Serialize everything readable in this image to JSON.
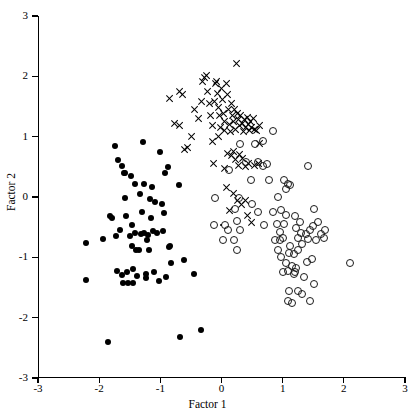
{
  "chart_data": {
    "type": "scatter",
    "title": "",
    "xlabel": "Factor 1",
    "ylabel": "Factor 2",
    "xlim": [
      -3,
      3
    ],
    "ylim": [
      -3,
      3
    ],
    "xticks": [
      -3,
      -2,
      -1,
      0,
      1,
      2,
      3
    ],
    "yticks": [
      -3,
      -2,
      -1,
      0,
      1,
      2,
      3
    ],
    "xticklabels": [
      "-3",
      "-2",
      "-1",
      "0",
      "1",
      "2",
      "3"
    ],
    "yticklabels": [
      "-3",
      "-2",
      "-1",
      "0",
      "1",
      "2",
      "3"
    ],
    "grid": false,
    "legend": "none",
    "series": [
      {
        "name": "Group 1",
        "marker": "filled-circle",
        "color": "#000000",
        "points": [
          [
            -2.22,
            -0.76
          ],
          [
            -2.22,
            -1.38
          ],
          [
            -1.93,
            -0.7
          ],
          [
            -1.86,
            -2.41
          ],
          [
            -1.82,
            -0.32
          ],
          [
            -1.79,
            -0.34
          ],
          [
            -1.74,
            0.84
          ],
          [
            -1.72,
            -0.64
          ],
          [
            -1.71,
            -1.22
          ],
          [
            -1.69,
            0.62
          ],
          [
            -1.66,
            -0.55
          ],
          [
            -1.63,
            0.52
          ],
          [
            -1.62,
            -1.3
          ],
          [
            -1.61,
            -1.42
          ],
          [
            -1.6,
            0.39
          ],
          [
            -1.58,
            -0.01
          ],
          [
            -1.56,
            -0.31
          ],
          [
            -1.55,
            -1.25
          ],
          [
            -1.53,
            -1.43
          ],
          [
            -1.5,
            -0.65
          ],
          [
            -1.48,
            0.35
          ],
          [
            -1.47,
            -0.46
          ],
          [
            -1.46,
            -0.81
          ],
          [
            -1.45,
            -1.2
          ],
          [
            -1.44,
            -1.42
          ],
          [
            -1.42,
            0.22
          ],
          [
            -1.41,
            -0.59
          ],
          [
            -1.4,
            -0.88
          ],
          [
            -1.38,
            -1.31
          ],
          [
            -1.35,
            -0.88
          ],
          [
            -1.33,
            0.05
          ],
          [
            -1.32,
            -0.62
          ],
          [
            -1.3,
            -0.25
          ],
          [
            -1.28,
            0.91
          ],
          [
            -1.27,
            0.21
          ],
          [
            -1.26,
            -0.6
          ],
          [
            -1.24,
            -1.28
          ],
          [
            -1.22,
            -0.72
          ],
          [
            -1.2,
            -0.63
          ],
          [
            -1.18,
            -0.88
          ],
          [
            -1.17,
            -0.04
          ],
          [
            -1.15,
            -0.35
          ],
          [
            -1.13,
            0.16
          ],
          [
            -1.12,
            -0.57
          ],
          [
            -1.1,
            -1.24
          ],
          [
            -1.08,
            -0.08
          ],
          [
            -1.05,
            -0.6
          ],
          [
            -1.02,
            -1.4
          ],
          [
            -1.0,
            0.75
          ],
          [
            -0.98,
            -0.12
          ],
          [
            -0.96,
            -0.56
          ],
          [
            -0.94,
            -0.26
          ],
          [
            -0.92,
            0.4
          ],
          [
            -0.9,
            -1.33
          ],
          [
            -0.88,
            0.5
          ],
          [
            -0.86,
            -0.83
          ],
          [
            -0.84,
            -0.82
          ],
          [
            -0.82,
            -1.1
          ],
          [
            -0.7,
            0.2
          ],
          [
            -0.68,
            -2.32
          ],
          [
            -0.62,
            -1.05
          ],
          [
            -0.45,
            -1.27
          ],
          [
            -0.33,
            -2.21
          ],
          [
            -1.58,
            0.4
          ],
          [
            -1.23,
            -1.35
          ]
        ]
      },
      {
        "name": "Group 2",
        "marker": "x",
        "color": "#000000",
        "points": [
          [
            -0.85,
            1.64
          ],
          [
            -0.68,
            1.75
          ],
          [
            -0.63,
            1.7
          ],
          [
            -0.76,
            1.22
          ],
          [
            -0.68,
            1.18
          ],
          [
            -0.6,
            0.78
          ],
          [
            -0.55,
            0.82
          ],
          [
            -0.48,
            1.0
          ],
          [
            -0.44,
            1.45
          ],
          [
            -0.38,
            1.3
          ],
          [
            -0.33,
            1.58
          ],
          [
            -0.3,
            1.92
          ],
          [
            -0.28,
            1.98
          ],
          [
            -0.25,
            2.02
          ],
          [
            -0.22,
            1.75
          ],
          [
            -0.2,
            1.55
          ],
          [
            -0.18,
            1.35
          ],
          [
            -0.15,
            1.18
          ],
          [
            -0.14,
            0.92
          ],
          [
            -0.11,
            1.58
          ],
          [
            -0.1,
            1.88
          ],
          [
            -0.08,
            1.92
          ],
          [
            -0.06,
            1.72
          ],
          [
            -0.05,
            1.48
          ],
          [
            -0.03,
            1.35
          ],
          [
            -0.02,
            1.15
          ],
          [
            0.0,
            1.8
          ],
          [
            0.02,
            1.62
          ],
          [
            0.03,
            1.38
          ],
          [
            0.05,
            1.25
          ],
          [
            0.06,
            1.1
          ],
          [
            0.08,
            1.88
          ],
          [
            0.1,
            1.7
          ],
          [
            0.11,
            1.45
          ],
          [
            0.13,
            1.2
          ],
          [
            0.15,
            1.08
          ],
          [
            0.16,
            1.55
          ],
          [
            0.18,
            1.35
          ],
          [
            0.2,
            1.25
          ],
          [
            0.22,
            1.45
          ],
          [
            0.24,
            1.12
          ],
          [
            0.25,
            2.22
          ],
          [
            0.26,
            1.38
          ],
          [
            0.28,
            1.28
          ],
          [
            0.3,
            1.18
          ],
          [
            0.32,
            1.35
          ],
          [
            0.34,
            1.22
          ],
          [
            0.36,
            1.08
          ],
          [
            0.38,
            1.28
          ],
          [
            0.4,
            1.15
          ],
          [
            0.42,
            1.32
          ],
          [
            0.44,
            1.2
          ],
          [
            0.46,
            1.1
          ],
          [
            0.48,
            1.25
          ],
          [
            0.5,
            1.15
          ],
          [
            0.52,
            1.3
          ],
          [
            0.55,
            1.12
          ],
          [
            0.58,
            1.1
          ],
          [
            0.62,
            1.18
          ],
          [
            -0.13,
            0.56
          ],
          [
            0.05,
            0.48
          ],
          [
            0.1,
            0.72
          ],
          [
            0.16,
            0.68
          ],
          [
            0.2,
            0.75
          ],
          [
            0.23,
            0.62
          ],
          [
            0.28,
            0.52
          ],
          [
            0.3,
            0.7
          ],
          [
            0.34,
            0.64
          ],
          [
            0.4,
            0.5
          ],
          [
            0.44,
            0.55
          ],
          [
            0.55,
            0.52
          ],
          [
            0.6,
            0.55
          ],
          [
            0.08,
            0.15
          ],
          [
            0.2,
            0.05
          ],
          [
            0.26,
            -0.06
          ],
          [
            0.33,
            -0.12
          ],
          [
            0.4,
            -0.05
          ],
          [
            0.42,
            -0.3
          ],
          [
            0.5,
            -0.42
          ],
          [
            0.62,
            0.88
          ],
          [
            0.14,
            -0.22
          ],
          [
            -0.05,
            1.0
          ]
        ]
      },
      {
        "name": "Group 3",
        "marker": "open-circle",
        "color": "#1a1a1a",
        "points": [
          [
            0.3,
            0.88
          ],
          [
            0.55,
            0.88
          ],
          [
            0.68,
            0.92
          ],
          [
            0.85,
            1.1
          ],
          [
            0.12,
            0.45
          ],
          [
            0.4,
            0.58
          ],
          [
            0.48,
            0.28
          ],
          [
            0.5,
            -0.12
          ],
          [
            0.6,
            -0.25
          ],
          [
            0.7,
            -0.47
          ],
          [
            0.28,
            -0.02
          ],
          [
            0.22,
            -0.2
          ],
          [
            0.25,
            -0.4
          ],
          [
            0.3,
            -0.55
          ],
          [
            0.2,
            -0.72
          ],
          [
            0.25,
            -0.88
          ],
          [
            0.05,
            -0.47
          ],
          [
            -0.1,
            -0.02
          ],
          [
            -0.12,
            -0.47
          ],
          [
            0.9,
            -0.45
          ],
          [
            0.95,
            -0.72
          ],
          [
            0.98,
            -1.0
          ],
          [
            1.0,
            -0.68
          ],
          [
            1.05,
            -1.1
          ],
          [
            1.08,
            -1.22
          ],
          [
            1.1,
            -0.92
          ],
          [
            1.12,
            -0.82
          ],
          [
            1.15,
            -1.15
          ],
          [
            1.18,
            -0.95
          ],
          [
            1.2,
            -1.24
          ],
          [
            1.22,
            -0.52
          ],
          [
            1.25,
            -0.68
          ],
          [
            1.28,
            -0.42
          ],
          [
            1.3,
            -0.6
          ],
          [
            1.05,
            -0.3
          ],
          [
            1.02,
            -0.45
          ],
          [
            0.98,
            -0.22
          ],
          [
            1.08,
            0.22
          ],
          [
            1.02,
            0.28
          ],
          [
            1.05,
            0.14
          ],
          [
            1.12,
            0.2
          ],
          [
            0.92,
            0.0
          ],
          [
            1.2,
            -0.32
          ],
          [
            1.25,
            -0.88
          ],
          [
            1.32,
            -0.78
          ],
          [
            1.38,
            -0.62
          ],
          [
            1.42,
            -0.7
          ],
          [
            1.45,
            -0.55
          ],
          [
            1.5,
            -0.48
          ],
          [
            1.52,
            -0.2
          ],
          [
            1.55,
            -0.72
          ],
          [
            1.48,
            -1.02
          ],
          [
            1.4,
            -1.08
          ],
          [
            1.42,
            0.52
          ],
          [
            1.52,
            -1.45
          ],
          [
            1.1,
            -1.55
          ],
          [
            1.08,
            -1.72
          ],
          [
            1.15,
            -1.75
          ],
          [
            1.25,
            -1.56
          ],
          [
            1.32,
            -1.6
          ],
          [
            1.45,
            -1.72
          ],
          [
            2.1,
            -1.09
          ],
          [
            0.6,
            0.58
          ],
          [
            0.75,
            0.55
          ],
          [
            0.02,
            -0.72
          ],
          [
            0.1,
            -0.55
          ],
          [
            0.88,
            -0.72
          ],
          [
            0.92,
            -0.88
          ],
          [
            1.0,
            -1.24
          ],
          [
            1.18,
            -1.28
          ],
          [
            1.22,
            -1.18
          ],
          [
            0.95,
            -0.58
          ],
          [
            0.85,
            -0.25
          ],
          [
            0.78,
            0.28
          ],
          [
            0.68,
            0.52
          ],
          [
            1.58,
            -0.42
          ],
          [
            1.62,
            -0.62
          ],
          [
            1.68,
            -0.68
          ],
          [
            1.7,
            -0.55
          ],
          [
            1.35,
            -1.32
          ]
        ]
      },
      {
        "name": "Group 3 small",
        "marker": "tiny-dot",
        "color": "#000000",
        "points": [
          [
            -0.01,
            -0.46
          ]
        ]
      }
    ]
  }
}
